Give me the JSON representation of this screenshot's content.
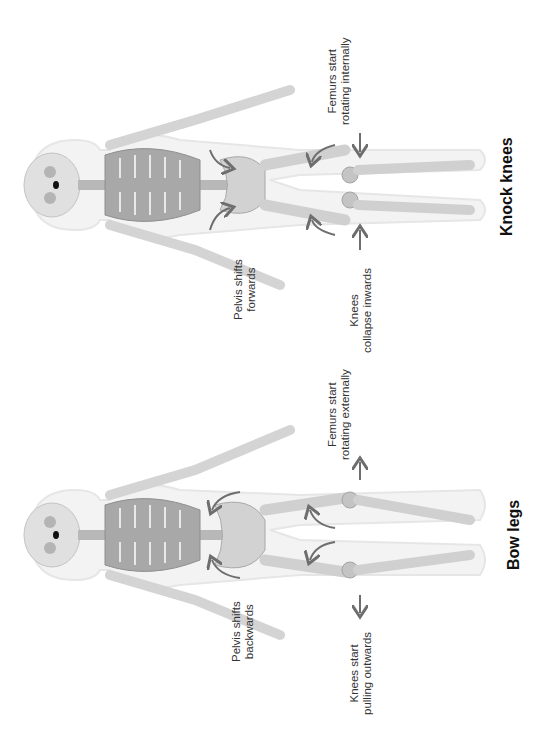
{
  "figure": {
    "orientation": "rotated-90-ccw",
    "colors": {
      "background": "#ffffff",
      "body_outline": "#ececec",
      "bone_light": "#d9d9d9",
      "bone_dark": "#9a9a9a",
      "arrow": "#6e6e6e",
      "text": "#333333",
      "title": "#111111"
    },
    "panels": [
      {
        "id": "knock-knees",
        "title": "Knock knees",
        "labels": {
          "pelvis": [
            "Pelvis shifts",
            "forwards"
          ],
          "femurs": [
            "Femurs start",
            "rotating internally"
          ],
          "knees": [
            "Knees",
            "collapse inwards"
          ]
        },
        "knee_arrow_direction": "inwards",
        "femur_rotation": "internal"
      },
      {
        "id": "bow-legs",
        "title": "Bow legs",
        "labels": {
          "pelvis": [
            "Pelvis shifts",
            "backwards"
          ],
          "femurs": [
            "Femurs start",
            "rotating externally"
          ],
          "knees": [
            "Knees start",
            "pulling outwards"
          ]
        },
        "knee_arrow_direction": "outwards",
        "femur_rotation": "external"
      }
    ]
  }
}
